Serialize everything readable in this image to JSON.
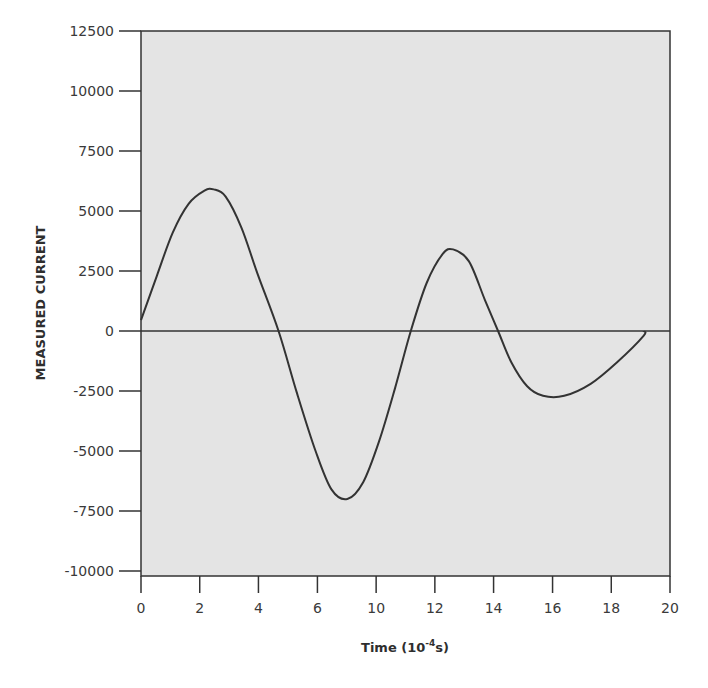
{
  "chart_data": {
    "type": "line",
    "title": "",
    "xlabel": "Time (10^-4 s)",
    "xlabel_main": "Time (10",
    "xlabel_sup": "-4",
    "xlabel_tail": "s)",
    "ylabel": "MEASURED CURRENT",
    "xlim": [
      0,
      20
    ],
    "ylim": [
      -10000,
      12500
    ],
    "grid": false,
    "legend": null,
    "x_ticks": [
      0,
      2,
      4,
      6,
      8,
      10,
      12,
      14,
      16,
      18,
      20
    ],
    "x_tick_positions": [
      0,
      2,
      4,
      6,
      8,
      10,
      12,
      14,
      16,
      18,
      20
    ],
    "x_tick_labels": [
      "0",
      "2",
      "4",
      "6",
      "10",
      "12",
      "14",
      "16",
      "18",
      "20"
    ],
    "x_tick_label_positions": [
      0,
      2.22,
      4.44,
      6.67,
      8.89,
      11.11,
      13.33,
      15.56,
      17.78,
      20
    ],
    "y_ticks": [
      12500,
      10000,
      7500,
      5000,
      2500,
      0,
      -2500,
      -5000,
      -7500,
      -10000
    ],
    "y_tick_labels": [
      "12500",
      "10000",
      "7500",
      "5000",
      "2500",
      "0",
      "-2500",
      "-5000",
      "-7500",
      "-10000"
    ],
    "zero_line": true,
    "series": [
      {
        "name": "Measured current",
        "color": "#333333",
        "x": [
          0,
          0.6,
          1.2,
          1.8,
          2.4,
          2.75,
          3.2,
          3.8,
          4.4,
          5.2,
          5.9,
          6.6,
          7.2,
          7.8,
          8.4,
          9.0,
          9.6,
          10.2,
          10.8,
          11.4,
          11.8,
          12.4,
          13.0,
          13.5,
          14.0,
          14.6,
          15.2,
          16.0,
          17.0,
          18.0,
          19.0,
          19.0
        ],
        "y": [
          450,
          2300,
          4100,
          5300,
          5850,
          5900,
          5600,
          4300,
          2400,
          0,
          -2600,
          -5000,
          -6600,
          -7000,
          -6300,
          -4600,
          -2400,
          0,
          2000,
          3200,
          3400,
          2900,
          1300,
          0,
          -1300,
          -2300,
          -2700,
          -2700,
          -2200,
          -1300,
          -200,
          0
        ]
      }
    ],
    "style": {
      "plot_background": "#e4e4e4",
      "axis_color": "#333333",
      "text_color": "#3a3a3a"
    }
  }
}
